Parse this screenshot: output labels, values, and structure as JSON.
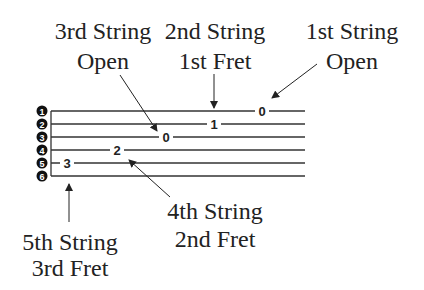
{
  "labels": {
    "third_open": {
      "line1": "3rd String",
      "line2": "Open"
    },
    "second_fret1": {
      "line1": "2nd String",
      "line2": "1st Fret"
    },
    "first_open": {
      "line1": "1st String",
      "line2": "Open"
    },
    "fourth_fret2": {
      "line1": "4th String",
      "line2": "2nd Fret"
    },
    "fifth_fret3": {
      "line1": "5th String",
      "line2": "3rd Fret"
    }
  },
  "strings": [
    "1",
    "2",
    "3",
    "4",
    "5",
    "6"
  ],
  "notes": [
    {
      "string": 5,
      "fret": "3"
    },
    {
      "string": 4,
      "fret": "2"
    },
    {
      "string": 3,
      "fret": "0"
    },
    {
      "string": 2,
      "fret": "1"
    },
    {
      "string": 1,
      "fret": "0"
    }
  ]
}
